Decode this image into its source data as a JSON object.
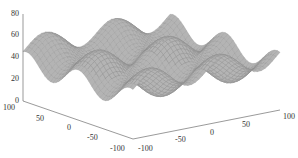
{
  "chart_data": {
    "type": "surface",
    "title": "",
    "xlabel": "",
    "ylabel": "",
    "zlabel": "",
    "x_range": [
      -100,
      100
    ],
    "y_range": [
      -100,
      100
    ],
    "zlim": [
      0,
      80
    ],
    "x_ticks": [
      -100,
      -50,
      0,
      50,
      100
    ],
    "y_ticks": [
      -100,
      -50,
      0,
      50,
      100
    ],
    "z_ticks": [
      0,
      20,
      40,
      60,
      80
    ],
    "x_tick_labels": [
      "-100",
      "-50",
      "0",
      "50",
      "100"
    ],
    "y_tick_labels": [
      "-100",
      "-50",
      "0",
      "50",
      "100"
    ],
    "z_tick_labels": [
      "0",
      "20",
      "40",
      "60",
      "80"
    ],
    "surface_function": "z = 40 + 10*sin(x/15) + 10*cos(y/15)",
    "z_approx_min": 20,
    "z_approx_max": 60,
    "mesh_color": "#8c8c8c",
    "grid": false
  }
}
